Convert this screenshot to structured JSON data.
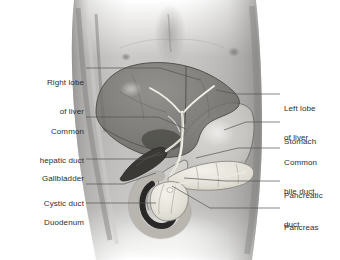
{
  "figure": {
    "style": "grayscale medical illustration",
    "colors": {
      "background": "#ffffff",
      "skin_mid": "#b9b8b6",
      "skin_shadow": "#8e8d8b",
      "liver": "#6f6e6c",
      "liver_edge": "#4a4947",
      "stomach": "#c9c8c5",
      "pancreas": "#e6e3dc",
      "duct": "#f3f1ea",
      "gallbladder": "#3e3d3b",
      "duodenum_lumen": "#2b2a28",
      "label_text": "#2e2e2e",
      "leader_line": "#555453"
    }
  },
  "labels": {
    "left": [
      {
        "id": "right-lobe-of-liver",
        "line1": "Right lobe",
        "line2": "of liver"
      },
      {
        "id": "common-hepatic-duct",
        "line1": "Common",
        "line2": "hepatic duct"
      },
      {
        "id": "gallbladder",
        "line1": "Gallbladder",
        "line2": ""
      },
      {
        "id": "cystic-duct",
        "line1": "Cystic duct",
        "line2": ""
      },
      {
        "id": "duodenum",
        "line1": "Duodenum",
        "line2": ""
      }
    ],
    "right": [
      {
        "id": "left-lobe-of-liver",
        "line1": "Left lobe",
        "line2": "of liver"
      },
      {
        "id": "stomach",
        "line1": "Stomach",
        "line2": ""
      },
      {
        "id": "common-bile-duct",
        "line1": "Common",
        "line2": "bile duct"
      },
      {
        "id": "pancreatic-duct",
        "line1": "Pancreatic",
        "line2": "duct"
      },
      {
        "id": "pancreas",
        "line1": "Pancreas",
        "line2": ""
      }
    ]
  }
}
